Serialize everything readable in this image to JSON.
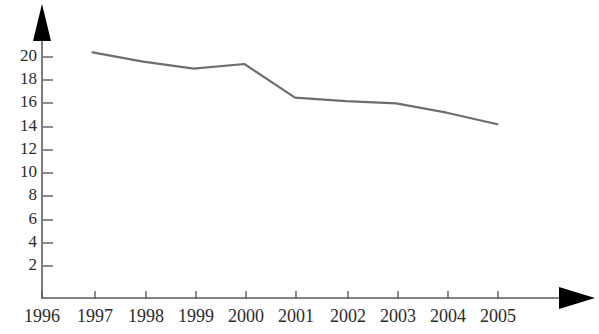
{
  "chart_data": {
    "type": "line",
    "title": "",
    "xlabel": "",
    "ylabel": "",
    "categories": [
      "1996",
      "1997",
      "1998",
      "1999",
      "2000",
      "2001",
      "2002",
      "2003",
      "2004",
      "2005"
    ],
    "x_tick_labels": [
      "1996",
      "1997",
      "1998",
      "1999",
      "2000",
      "2001",
      "2002",
      "2003",
      "2004",
      "2005"
    ],
    "y_tick_labels": [
      "2",
      "4",
      "6",
      "8",
      "10",
      "12",
      "14",
      "16",
      "18",
      "20"
    ],
    "y_ticks": [
      2,
      4,
      6,
      8,
      10,
      12,
      14,
      16,
      18,
      20
    ],
    "ylim": [
      0,
      21.5
    ],
    "grid": false,
    "legend": null,
    "series": [
      {
        "name": "series-1",
        "x": [
          "1997",
          "1998",
          "1999",
          "2000",
          "2001",
          "2002",
          "2003",
          "2004",
          "2005"
        ],
        "values": [
          20.4,
          19.6,
          19.0,
          19.4,
          16.5,
          16.2,
          16.0,
          15.2,
          14.2
        ]
      }
    ],
    "line_color": "#6e6e6e",
    "axis_color": "#5a5a5a",
    "arrow_color": "#000000"
  },
  "axes": {
    "y_axis_name": "vertical-value-axis",
    "x_axis_name": "horizontal-year-axis",
    "y_arrow_name": "y-axis-arrow-icon",
    "x_arrow_name": "x-axis-arrow-icon"
  }
}
